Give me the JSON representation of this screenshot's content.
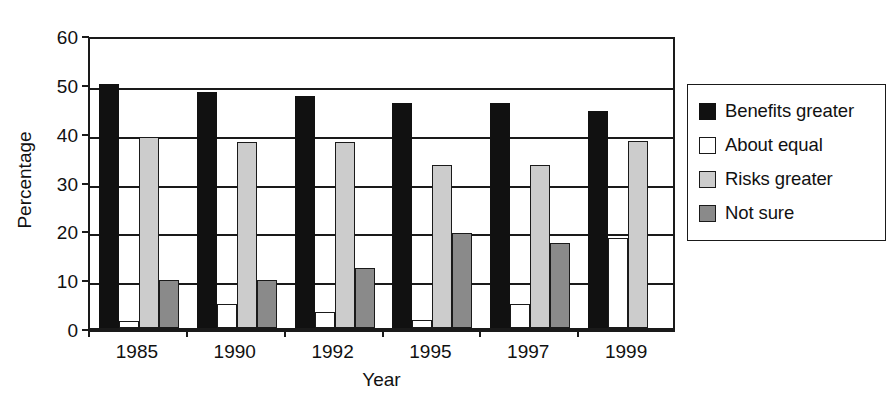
{
  "chart_data": {
    "type": "bar",
    "title": "",
    "xlabel": "Year",
    "ylabel": "Percentage",
    "categories": [
      "1985",
      "1990",
      "1992",
      "1995",
      "1997",
      "1999"
    ],
    "ylim": [
      0,
      60
    ],
    "yticks": [
      0,
      10,
      20,
      30,
      40,
      50,
      60
    ],
    "ytick_labels": [
      "0",
      "10",
      "20",
      "30",
      "40",
      "50",
      "60"
    ],
    "grid": true,
    "grid_axis": "y",
    "legend_position": "right-outside",
    "series": [
      {
        "name": "Benefits greater",
        "color": "#111111",
        "values": [
          50.0,
          48.3,
          47.5,
          46.1,
          46.1,
          44.5
        ]
      },
      {
        "name": "About equal",
        "color": "#ffffff",
        "values": [
          1.5,
          5.0,
          3.2,
          1.6,
          5.0,
          18.5
        ]
      },
      {
        "name": "Risks greater",
        "color": "#cccccc",
        "values": [
          39.2,
          38.0,
          38.0,
          33.4,
          33.4,
          38.3
        ]
      },
      {
        "name": "Not sure",
        "color": "#8a8a8a",
        "values": [
          9.8,
          9.8,
          12.2,
          19.4,
          17.4,
          0.0
        ]
      }
    ]
  },
  "legend": {
    "items": [
      {
        "label": "Benefits greater",
        "swatch": "black-square-swatch"
      },
      {
        "label": "About equal",
        "swatch": "white-square-swatch"
      },
      {
        "label": "Risks greater",
        "swatch": "light-gray-square-swatch"
      },
      {
        "label": "Not sure",
        "swatch": "dark-gray-square-swatch"
      }
    ]
  }
}
